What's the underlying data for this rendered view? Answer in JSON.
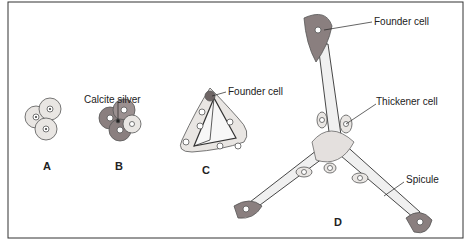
{
  "figure": {
    "panels": [
      {
        "id": "A",
        "label": "A"
      },
      {
        "id": "B",
        "label": "B",
        "callouts": [
          "Calcite silver"
        ]
      },
      {
        "id": "C",
        "label": "C",
        "callouts": [
          "Founder cell"
        ]
      },
      {
        "id": "D",
        "label": "D",
        "callouts": [
          "Founder cell",
          "Thickener cell",
          "Spicule"
        ]
      }
    ]
  },
  "labels": {
    "calcite_silver": "Calcite silver",
    "founder_cell_c": "Founder cell",
    "founder_cell_d": "Founder cell",
    "thickener_cell": "Thickener cell",
    "spicule": "Spicule",
    "panel_a": "A",
    "panel_b": "B",
    "panel_c": "C",
    "panel_d": "D"
  },
  "colors": {
    "cell_fill": "#e9e6e3",
    "cell_stroke": "#555555",
    "founder_fill": "#8a7f7f",
    "spicule_fill": "#f2f2f2",
    "border": "#333333",
    "leader": "#222222"
  }
}
